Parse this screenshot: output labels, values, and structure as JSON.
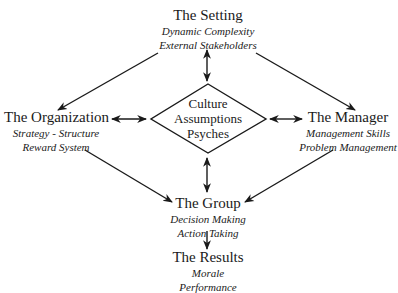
{
  "diagram": {
    "setting": {
      "title": "The Setting",
      "lines": [
        "Dynamic Complexity",
        "External Stakeholders"
      ]
    },
    "organization": {
      "title": "The Organization",
      "lines": [
        "Strategy - Structure",
        "Reward System"
      ]
    },
    "center": {
      "lines": [
        "Culture",
        "Assumptions",
        "Psyches"
      ]
    },
    "manager": {
      "title": "The Manager",
      "lines": [
        "Management Skills",
        "Problem Management"
      ]
    },
    "group": {
      "title": "The Group",
      "lines": [
        "Decision Making",
        "Action Taking"
      ]
    },
    "results": {
      "title": "The Results",
      "lines": [
        "Morale",
        "Performance"
      ]
    },
    "connections": [
      {
        "from": "setting",
        "to": "organization",
        "type": "one-way"
      },
      {
        "from": "setting",
        "to": "manager",
        "type": "one-way"
      },
      {
        "from": "setting",
        "to": "center",
        "type": "two-way"
      },
      {
        "from": "organization",
        "to": "center",
        "type": "two-way"
      },
      {
        "from": "manager",
        "to": "center",
        "type": "two-way"
      },
      {
        "from": "center",
        "to": "group",
        "type": "two-way"
      },
      {
        "from": "organization",
        "to": "group",
        "type": "one-way"
      },
      {
        "from": "manager",
        "to": "group",
        "type": "one-way"
      },
      {
        "from": "group",
        "to": "results",
        "type": "one-way"
      }
    ],
    "colors": {
      "ink": "#1a1a1a",
      "background": "#ffffff"
    }
  }
}
